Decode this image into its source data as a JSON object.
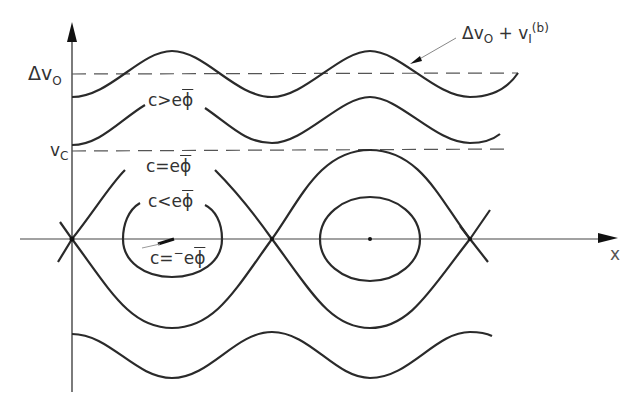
{
  "figure": {
    "axes": {
      "x_label": "x",
      "y_levels": [
        {
          "id": "delta_v0",
          "label": "Δv",
          "subscript": "O"
        },
        {
          "id": "vc",
          "label": "v",
          "subscript": "C"
        }
      ]
    },
    "annotations": {
      "top_curve": {
        "main": "Δv",
        "sub": "O",
        "plus": " + v",
        "sub2": "I",
        "sup": "(b)"
      },
      "c_gt": {
        "prefix": "c>e",
        "phi": "ϕ"
      },
      "c_eq": {
        "prefix": "c=e",
        "phi": "ϕ"
      },
      "c_lt": {
        "prefix": "c<e",
        "phi": "ϕ"
      },
      "c_min": {
        "prefix": "c=",
        "neg": "−",
        "e": "e",
        "phi": "ϕ"
      }
    },
    "colors": {
      "stroke": "#2a2a2a",
      "dash": "#555555",
      "axis": "#444444"
    }
  }
}
